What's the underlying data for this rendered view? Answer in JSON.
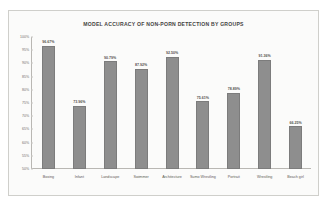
{
  "chart_data": {
    "type": "bar",
    "title": "MODEL ACCURACY OF NON-PORN DETECTION BY GROUPS",
    "xlabel": "",
    "ylabel": "",
    "grid": false,
    "legend": "none",
    "ylim": [
      50,
      100
    ],
    "yticks": [
      "100%",
      "95%",
      "90%",
      "85%",
      "80%",
      "75%",
      "70%",
      "65%",
      "60%",
      "55%",
      "50%"
    ],
    "ytick_values": [
      100,
      95,
      90,
      85,
      80,
      75,
      70,
      65,
      60,
      55,
      50
    ],
    "categories": [
      "Boxing",
      "Infant",
      "Landscape",
      "Swimmer",
      "Architecture",
      "Sumo Wrestling",
      "Portrait",
      "Wrestling",
      "Beach girl"
    ],
    "values": [
      96.67,
      73.96,
      90.79,
      87.92,
      92.5,
      75.61,
      78.89,
      91.36,
      66.25
    ],
    "value_labels": [
      "96.67%",
      "73.96%",
      "90.79%",
      "87.92%",
      "92.50%",
      "75.61%",
      "78.89%",
      "91.36%",
      "66.25%"
    ],
    "bar_color": "#8e8e8e",
    "background_color": "#fbfbfa",
    "border_color": "#cfcfcb",
    "title_color": "#44423f",
    "axis_text_color": "#6f6c68"
  }
}
